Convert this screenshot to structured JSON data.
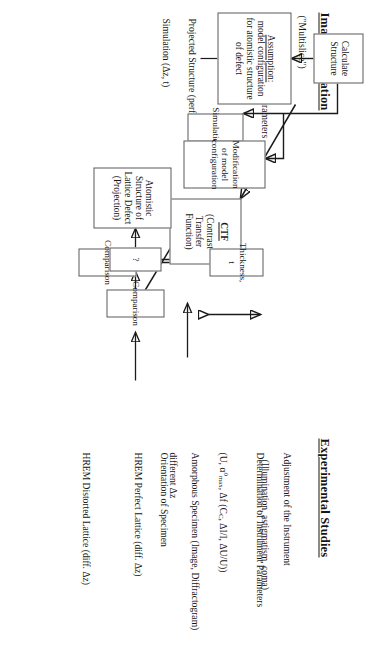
{
  "document": {
    "type": "flowchart",
    "orientation": "landscape-page-rotated-90deg-clockwise",
    "background_color": "#ffffff",
    "ink_color": "#161616",
    "box_border_color": "#5a5a5a"
  },
  "left_column": {
    "heading": "Experimental Studies",
    "items": [
      {
        "name": "adjustment",
        "line1": "Adjustment of the Instrument",
        "line2": "(Illumination, astigmatism, coma)"
      },
      {
        "name": "determination",
        "line1": "Determination of Instrument Parameters"
      },
      {
        "name": "parameters-formula",
        "prefix": "(U, α",
        "sup": "0",
        "sub": "max",
        "suffix": ", Δf (C",
        "suffix_sub": "C",
        "suffix2": ", ΔI/I, ΔU/U))"
      },
      {
        "name": "amorphous-specimen",
        "line1": "Amorphous Specimen (Image, Diffractogram)",
        "line2": "different Δz"
      },
      {
        "name": "orientation",
        "line1": "Orientation of Specimen"
      },
      {
        "name": "hrem-perfect",
        "line1": "HREM Perfect Lattice (diff. Δz)"
      },
      {
        "name": "hrem-distorted",
        "line1": "HREM Distorted Lattice (diff. Δz)"
      }
    ]
  },
  "right_column": {
    "heading": "Image Simulation",
    "subheading": "(\"Multislice\")",
    "items": [
      {
        "name": "input-parameters",
        "line1": "Input of Instrument Parameters"
      },
      {
        "name": "projected-structure",
        "line1": "Projected Structure (perfect lattice)"
      },
      {
        "name": "simulation-dz-t",
        "line1": "Simulation (Δz, t)"
      }
    ]
  },
  "boxes": {
    "ctf": {
      "title": "CTF",
      "subtitle": "(Contrast Transfer Function)"
    },
    "comparison_upper": {
      "label": "Comparison"
    },
    "thickness": {
      "label": "Thickness, t"
    },
    "comparison_lower": {
      "label": "Comparison"
    },
    "question": {
      "label": "?"
    },
    "atomistic_structure": {
      "label": "Atomistic Structure of\nLattice Defect\n(Projection)"
    },
    "calculate_structure": {
      "label": "Calculate\nStructure"
    },
    "assumption": {
      "title": "Assumption:",
      "rest": " model configuration\nfor atomistic structure\nof defect"
    },
    "simulation": {
      "label": "Simulation"
    },
    "modification": {
      "label": "Modification of model\nconfiguration"
    }
  }
}
